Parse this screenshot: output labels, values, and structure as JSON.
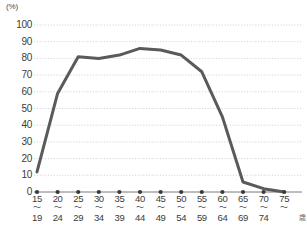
{
  "chart_data": {
    "type": "line",
    "title": "",
    "xlabel": "",
    "ylabel": "",
    "y_unit": "(%)",
    "x_unit": "歳",
    "grid": true,
    "legend": "none",
    "ylim": [
      0,
      100
    ],
    "ytick_step": 10,
    "yticks": [
      "100",
      "90",
      "80",
      "70",
      "60",
      "50",
      "40",
      "30",
      "20",
      "10",
      "0"
    ],
    "categories": [
      "15～19",
      "20～24",
      "25～29",
      "30～34",
      "35～39",
      "40～44",
      "45～49",
      "50～54",
      "55～59",
      "60～64",
      "65～69",
      "70～74",
      "75～"
    ],
    "category_parts": [
      {
        "lo": "15",
        "sep": "～",
        "hi": "19"
      },
      {
        "lo": "20",
        "sep": "～",
        "hi": "24"
      },
      {
        "lo": "25",
        "sep": "～",
        "hi": "29"
      },
      {
        "lo": "30",
        "sep": "～",
        "hi": "34"
      },
      {
        "lo": "35",
        "sep": "～",
        "hi": "39"
      },
      {
        "lo": "40",
        "sep": "～",
        "hi": "44"
      },
      {
        "lo": "45",
        "sep": "～",
        "hi": "49"
      },
      {
        "lo": "50",
        "sep": "～",
        "hi": "54"
      },
      {
        "lo": "55",
        "sep": "～",
        "hi": "59"
      },
      {
        "lo": "60",
        "sep": "～",
        "hi": "64"
      },
      {
        "lo": "65",
        "sep": "～",
        "hi": "69"
      },
      {
        "lo": "70",
        "sep": "～",
        "hi": "74"
      },
      {
        "lo": "75",
        "sep": "～",
        "hi": ""
      }
    ],
    "values": [
      12,
      59,
      81,
      80,
      82,
      86,
      85,
      82,
      72,
      45,
      6,
      2,
      0
    ],
    "series": [
      {
        "name": "",
        "values": [
          12,
          59,
          81,
          80,
          82,
          86,
          85,
          82,
          72,
          45,
          6,
          2,
          0
        ]
      }
    ],
    "line_color": "#5a5a5a",
    "grid_color": "#c9c9d6",
    "axis_color": "#7a7a7a",
    "marker_color": "#3a3a3a"
  }
}
